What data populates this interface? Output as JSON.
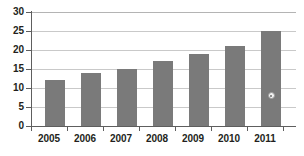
{
  "chart_data": {
    "type": "bar",
    "title": "",
    "subtitle": "",
    "xlabel": "",
    "ylabel": "",
    "categories": [
      "2005",
      "2006",
      "2007",
      "2008",
      "2009",
      "2010",
      "2011"
    ],
    "values": [
      12,
      14,
      15,
      17,
      19,
      21,
      25
    ],
    "series": [
      {
        "name": "",
        "values": [
          12,
          14,
          15,
          17,
          19,
          21,
          25
        ]
      }
    ],
    "ylim": [
      0,
      30
    ],
    "ytick_values": [
      0,
      5,
      10,
      15,
      20,
      25,
      30
    ],
    "ytick_labels": [
      "0",
      "5",
      "10",
      "15",
      "20",
      "25",
      "30"
    ],
    "grid": true,
    "grid_axis": "y",
    "legend": false,
    "legend_position": "none",
    "annotations": [
      {
        "type": "point-marker",
        "category": "2011",
        "value": 8,
        "shape": "circle",
        "fill_color": "#f2f2f2",
        "edge_color": "#9a9a9a",
        "label": ""
      }
    ],
    "colors": {
      "bar": "#7a7a7a",
      "gridline": "#c9c9c9",
      "axis": "#5e5e5e",
      "text": "#231f20",
      "background": "#ffffff"
    }
  }
}
